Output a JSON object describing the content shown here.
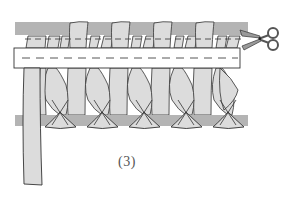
{
  "diagram": {
    "step_label": "(3)",
    "icons": {
      "scissors": "scissors-icon"
    },
    "colors": {
      "background": "#ffffff",
      "gray_band": "#b4b4b4",
      "strip_fill": "#dcdcdc",
      "white_band": "#ffffff",
      "outline": "#333333",
      "dash": "#444444",
      "scissors_fill": "#9a9a9a"
    },
    "elements": {
      "top_gray_band": "top-gray-band",
      "white_band": "white-band-with-dashed-line",
      "bottom_gray_band": "bottom-gray-band",
      "strips_count": 6,
      "hanging_strip": "long-hanging-strip-left"
    }
  }
}
